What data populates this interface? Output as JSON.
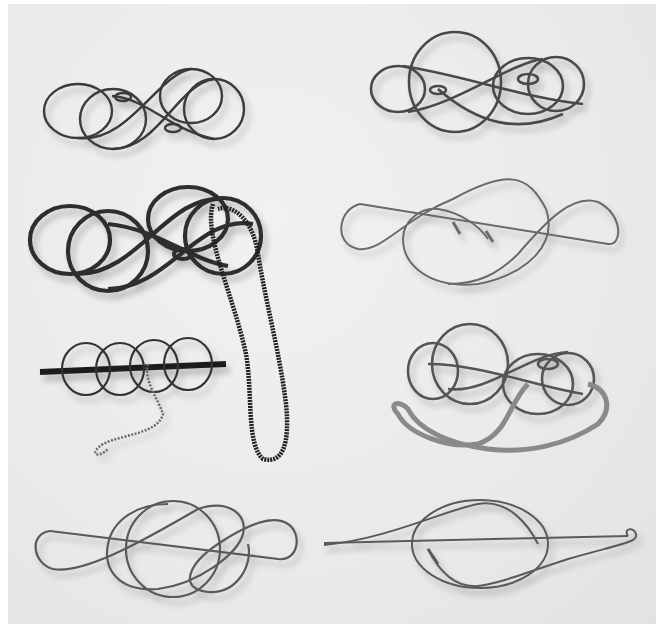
{
  "image": {
    "subject": "Eight metal wire disentanglement puzzles photographed on a light gray background",
    "style": "black-and-white photograph",
    "background_color": "#ebebeb",
    "page_color": "#ffffff"
  },
  "objects": [
    {
      "id": "puzzle-1",
      "position": "top-left",
      "description": "dark wire double figure-eight puzzle with small loops",
      "color": "#3a3a3a"
    },
    {
      "id": "puzzle-2",
      "position": "top-right",
      "description": "chrome wire double figure-eight puzzle with interlocked loops",
      "color": "#4a4a4a"
    },
    {
      "id": "puzzle-3",
      "position": "middle-left upper",
      "description": "thick dark wire double figure-eight puzzle with long black braided cord",
      "color": "#2e2e2e"
    },
    {
      "id": "puzzle-4",
      "position": "middle-right upper",
      "description": "thin silver wire treble-clef-shaped puzzle",
      "color": "#6a6a6a"
    },
    {
      "id": "puzzle-5",
      "position": "middle-left lower",
      "description": "chain of circular wire loops on a dark bar with a twisted silver string",
      "color": "#333333"
    },
    {
      "id": "puzzle-6",
      "position": "middle-right lower",
      "description": "chrome wire figure-eight puzzle with gray braided cord loop",
      "color": "#555555"
    },
    {
      "id": "puzzle-7",
      "position": "bottom-left",
      "description": "silver wire double-loop knot puzzle",
      "color": "#5a5a5a"
    },
    {
      "id": "puzzle-8",
      "position": "bottom-right",
      "description": "silver wire ring puzzle with long straight pin",
      "color": "#5a5a5a"
    }
  ]
}
